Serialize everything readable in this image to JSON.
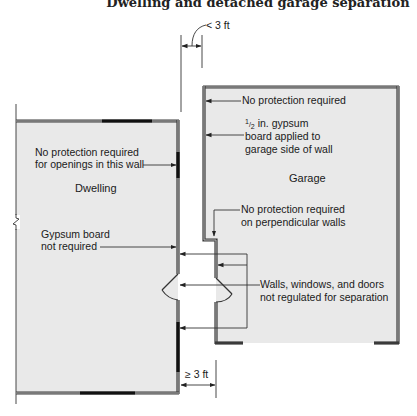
{
  "title": "Dwelling and detached garage separation",
  "colors": {
    "room_fill": "#e9e9e9",
    "wall": "#3a3a3a",
    "line": "#333333",
    "background": "#ffffff"
  },
  "dimensions": {
    "top": "< 3 ft",
    "bottom": "≥ 3 ft"
  },
  "dwelling": {
    "label": "Dwelling",
    "note_openings": [
      "No protection required",
      "for openings in this wall"
    ],
    "note_gypsum": [
      "Gypsum board",
      "not required"
    ]
  },
  "garage": {
    "label": "Garage",
    "note_top": "No protection required",
    "note_gypsum_fraction_num": "1",
    "note_gypsum_fraction_den": "2",
    "note_gypsum": [
      " in. gypsum",
      "board applied to",
      "garage side of wall"
    ],
    "note_perpendicular": [
      "No protection required",
      "on perpendicular walls"
    ],
    "note_unregulated": [
      "Walls, windows, and doors",
      "not regulated for separation"
    ]
  },
  "icons": [
    "arrow-icon",
    "door-swing-icon",
    "break-line-icon",
    "dimension-arrow-icon"
  ]
}
